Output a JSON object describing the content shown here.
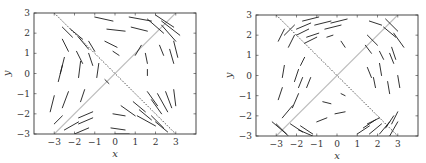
{
  "chart_data": [
    {
      "type": "quiver",
      "title": "",
      "xlabel": "x",
      "ylabel": "y",
      "xlim": [
        -4,
        4
      ],
      "ylim": [
        -3,
        3
      ],
      "xticks": [
        -3,
        -2,
        -1,
        0,
        1,
        2,
        3
      ],
      "yticks": [
        -3,
        -2,
        -1,
        0,
        1,
        2,
        3
      ],
      "grid": false,
      "frame_px": {
        "left": 34,
        "top": 13,
        "right": 196,
        "bottom": 134
      },
      "reference_lines": [
        {
          "name": "solid-diagonal",
          "style": "solid",
          "color": "#bdbdbd",
          "from": [
            -3,
            -3
          ],
          "to": [
            3,
            3
          ]
        },
        {
          "name": "dashed-antidiagonal",
          "style": "dashed",
          "color": "#222222",
          "from": [
            -3,
            3
          ],
          "to": [
            3,
            -3
          ]
        }
      ],
      "segments": [
        [
          0.7,
          2.8,
          1.8,
          2.6
        ],
        [
          -1.0,
          2.8,
          -0.1,
          2.6
        ],
        [
          -0.4,
          2.2,
          0.5,
          2.1
        ],
        [
          0.8,
          2.3,
          1.6,
          2.1
        ],
        [
          2.0,
          2.9,
          2.9,
          2.3
        ],
        [
          2.3,
          2.6,
          3.2,
          1.9
        ],
        [
          1.6,
          2.7,
          2.4,
          2.0
        ],
        [
          2.3,
          2.4,
          3.0,
          1.6
        ],
        [
          -2.6,
          2.3,
          -2.1,
          1.8
        ],
        [
          -2.2,
          2.2,
          -1.6,
          1.7
        ],
        [
          -1.8,
          1.8,
          -1.3,
          1.2
        ],
        [
          -1.3,
          1.6,
          -1.0,
          1.1
        ],
        [
          -2.6,
          1.7,
          -2.3,
          1.1
        ],
        [
          -1.9,
          1.1,
          -1.6,
          0.5
        ],
        [
          -1.3,
          1.0,
          -1.1,
          0.4
        ],
        [
          -0.5,
          1.6,
          0.1,
          1.3
        ],
        [
          -0.1,
          1.1,
          0.2,
          0.9
        ],
        [
          -2.5,
          0.8,
          -2.7,
          0.0
        ],
        [
          -2.6,
          0.4,
          -2.8,
          -0.4
        ],
        [
          -1.7,
          0.6,
          -1.8,
          -0.2
        ],
        [
          -0.8,
          0.5,
          -0.9,
          -0.2
        ],
        [
          -2.3,
          -0.9,
          -2.6,
          -1.7
        ],
        [
          -3.0,
          -1.1,
          -3.2,
          -1.9
        ],
        [
          -1.5,
          -0.8,
          -1.7,
          -1.4
        ],
        [
          1.0,
          0.9,
          1.3,
          1.4
        ],
        [
          1.5,
          1.0,
          1.6,
          0.5
        ],
        [
          2.2,
          1.4,
          2.4,
          0.9
        ],
        [
          2.9,
          1.6,
          3.1,
          0.8
        ],
        [
          2.7,
          1.2,
          2.9,
          0.5
        ],
        [
          1.6,
          0.2,
          1.6,
          -0.1
        ],
        [
          -0.5,
          -0.3,
          -0.3,
          -0.5
        ],
        [
          1.6,
          -0.9,
          2.1,
          -1.6
        ],
        [
          2.1,
          -1.0,
          2.6,
          -1.9
        ],
        [
          2.5,
          -0.9,
          2.8,
          -1.7
        ],
        [
          2.9,
          -0.8,
          3.0,
          -1.6
        ],
        [
          1.8,
          -1.3,
          2.3,
          -2.0
        ],
        [
          1.2,
          -1.8,
          1.8,
          -2.3
        ],
        [
          0.9,
          -1.4,
          1.5,
          -1.9
        ],
        [
          0.3,
          -1.6,
          1.0,
          -2.1
        ],
        [
          1.1,
          -2.1,
          2.0,
          -2.6
        ],
        [
          1.8,
          -2.1,
          2.4,
          -2.7
        ],
        [
          2.0,
          -2.4,
          2.6,
          -2.9
        ],
        [
          -0.1,
          -2.0,
          0.5,
          -2.1
        ],
        [
          -1.8,
          -2.5,
          -1.1,
          -2.2
        ],
        [
          -1.8,
          -2.2,
          -1.1,
          -1.9
        ],
        [
          -2.5,
          -2.8,
          -1.8,
          -2.4
        ],
        [
          -3.0,
          -2.5,
          -2.6,
          -2.1
        ],
        [
          -2.0,
          -3.0,
          -1.3,
          -2.7
        ],
        [
          -0.2,
          -2.7,
          0.5,
          -2.8
        ],
        [
          0.0,
          -3.0,
          0.7,
          -3.0
        ]
      ]
    },
    {
      "type": "quiver",
      "title": "",
      "xlabel": "x",
      "ylabel": "y",
      "xlim": [
        -4,
        4
      ],
      "ylim": [
        -3,
        3
      ],
      "xticks": [
        -3,
        -2,
        -1,
        0,
        1,
        2,
        3
      ],
      "yticks": [
        -3,
        -2,
        -1,
        0,
        1,
        2,
        3
      ],
      "grid": false,
      "frame_px": {
        "left": 256,
        "top": 15,
        "right": 418,
        "bottom": 136
      },
      "reference_lines": [
        {
          "name": "solid-diagonal",
          "style": "solid",
          "color": "#bdbdbd",
          "from": [
            -3,
            -3
          ],
          "to": [
            3,
            3
          ]
        },
        {
          "name": "dashed-antidiagonal",
          "style": "dashed",
          "color": "#222222",
          "from": [
            -3,
            3
          ],
          "to": [
            3,
            -3
          ]
        }
      ],
      "segments": [
        [
          -1.7,
          2.7,
          -0.9,
          2.9
        ],
        [
          -1.1,
          2.5,
          -0.3,
          2.7
        ],
        [
          -0.6,
          2.3,
          0.2,
          2.5
        ],
        [
          -0.3,
          2.6,
          0.5,
          2.8
        ],
        [
          -2.0,
          2.3,
          -1.3,
          2.6
        ],
        [
          -2.6,
          2.0,
          -2.1,
          2.5
        ],
        [
          -2.0,
          2.0,
          -1.4,
          2.3
        ],
        [
          1.6,
          2.7,
          2.2,
          2.5
        ],
        [
          2.4,
          2.8,
          3.0,
          2.2
        ],
        [
          2.3,
          2.4,
          2.9,
          1.9
        ],
        [
          2.8,
          2.1,
          3.3,
          1.4
        ],
        [
          1.5,
          2.0,
          2.0,
          1.5
        ],
        [
          -2.9,
          1.7,
          -2.6,
          2.3
        ],
        [
          -2.4,
          1.4,
          -2.1,
          2.0
        ],
        [
          -1.5,
          1.9,
          -0.9,
          2.1
        ],
        [
          -1.6,
          1.6,
          -1.0,
          1.9
        ],
        [
          -0.5,
          1.9,
          -0.2,
          2.0
        ],
        [
          0.2,
          1.7,
          0.4,
          1.4
        ],
        [
          1.4,
          1.5,
          1.7,
          1.1
        ],
        [
          2.1,
          1.2,
          2.3,
          0.8
        ],
        [
          2.7,
          1.4,
          2.9,
          0.8
        ],
        [
          2.6,
          1.1,
          2.8,
          0.6
        ],
        [
          -1.8,
          0.5,
          -1.6,
          0.9
        ],
        [
          -2.7,
          -0.1,
          -2.6,
          0.5
        ],
        [
          -2.1,
          -0.3,
          -1.9,
          0.3
        ],
        [
          -1.5,
          -0.6,
          -1.3,
          -0.1
        ],
        [
          -1.9,
          -0.6,
          -1.7,
          -0.1
        ],
        [
          1.5,
          0.4,
          1.7,
          -0.1
        ],
        [
          2.1,
          0.6,
          2.2,
          0.0
        ],
        [
          1.8,
          -0.1,
          1.9,
          -0.6
        ],
        [
          2.5,
          -0.3,
          2.6,
          -0.9
        ],
        [
          3.0,
          0.0,
          3.1,
          -0.6
        ],
        [
          -2.9,
          -1.2,
          -2.7,
          -0.6
        ],
        [
          -2.2,
          -1.6,
          -1.9,
          -0.9
        ],
        [
          -2.7,
          -2.1,
          -2.2,
          -1.5
        ],
        [
          -0.7,
          -1.3,
          -0.3,
          -1.4
        ],
        [
          -0.1,
          -1.9,
          0.4,
          -1.8
        ],
        [
          -1.0,
          -2.3,
          -0.5,
          -2.1
        ],
        [
          0.2,
          -0.9,
          0.4,
          -1.0
        ],
        [
          -3.2,
          -2.3,
          -2.5,
          -2.9
        ],
        [
          -3.0,
          -2.4,
          -2.4,
          -3.0
        ],
        [
          -2.3,
          -2.4,
          -1.7,
          -2.8
        ],
        [
          -1.9,
          -2.7,
          -1.2,
          -3.0
        ],
        [
          -1.8,
          -2.5,
          -1.2,
          -2.9
        ],
        [
          1.0,
          -2.9,
          1.6,
          -2.5
        ],
        [
          1.3,
          -2.6,
          1.9,
          -2.2
        ],
        [
          1.6,
          -2.9,
          2.2,
          -2.4
        ],
        [
          2.1,
          -2.9,
          2.6,
          -2.3
        ],
        [
          2.6,
          -3.0,
          3.0,
          -2.3
        ],
        [
          1.5,
          -2.4,
          2.1,
          -2.1
        ],
        [
          2.7,
          -2.4,
          3.0,
          -1.8
        ],
        [
          2.4,
          -2.6,
          2.8,
          -2.0
        ]
      ]
    }
  ]
}
